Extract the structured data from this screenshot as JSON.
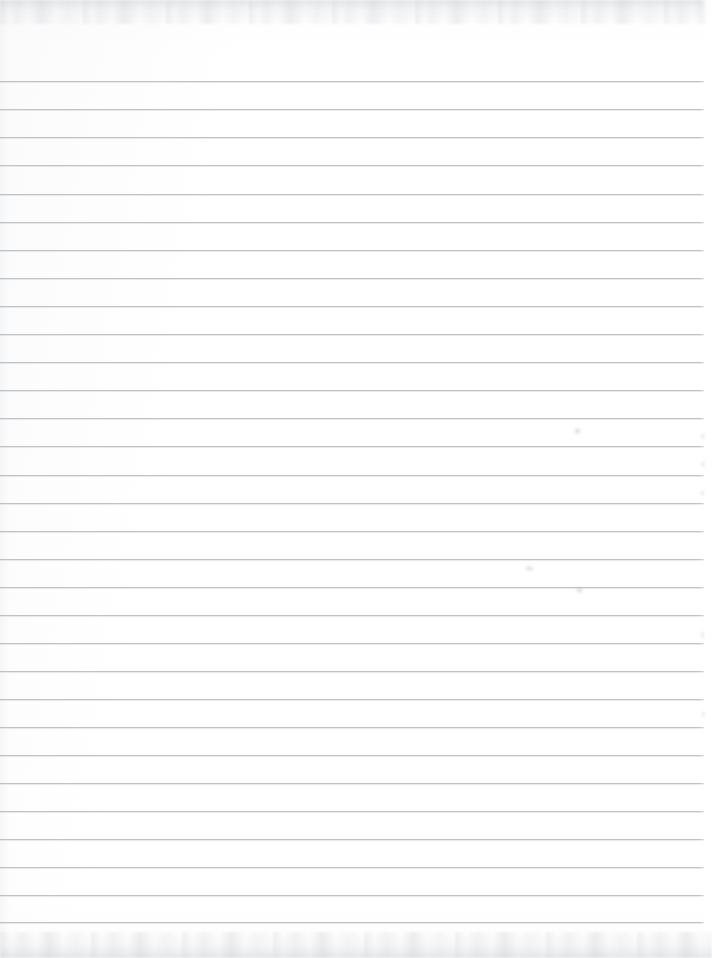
{
  "document": {
    "kind": "scanned-lined-paper",
    "title": "Blank ruled notebook paper scan",
    "page_width": 712,
    "page_height": 958,
    "text_content": "",
    "handwriting": "",
    "colors": {
      "paper": "#ffffff",
      "rule_line": "#bfc2c7",
      "rule_line_soft": "#cdd0d5",
      "scan_edge": "#c4c7cc"
    }
  },
  "ruling": {
    "line_count": 31,
    "first_line_y": 81,
    "spacing_px": 28.05,
    "line_left_x": 0,
    "line_right_x": 704,
    "line_thickness_px": 1,
    "lines_y": [
      81,
      109,
      137,
      165,
      194,
      222,
      250,
      278,
      306,
      334,
      362,
      390,
      418,
      446,
      475,
      503,
      531,
      559,
      587,
      615,
      643,
      671,
      699,
      727,
      755,
      783,
      811,
      839,
      867,
      895,
      922
    ]
  },
  "edges": {
    "top_band_label": "scan-edge-top",
    "top_band_height": 24,
    "bottom_band_label": "scan-edge-bottom",
    "bottom_band_height": 26,
    "right_margin_width": 12
  },
  "artifacts": [
    {
      "name": "smudge-right-upper",
      "x": 573,
      "y": 427,
      "w": 9,
      "h": 8
    },
    {
      "name": "smudge-right-edge-a",
      "x": 700,
      "y": 432,
      "w": 7,
      "h": 9
    },
    {
      "name": "smudge-right-edge-b",
      "x": 700,
      "y": 460,
      "w": 7,
      "h": 9
    },
    {
      "name": "smudge-right-edge-c",
      "x": 700,
      "y": 489,
      "w": 6,
      "h": 8
    },
    {
      "name": "smudge-mid-lower",
      "x": 524,
      "y": 565,
      "w": 11,
      "h": 7
    },
    {
      "name": "smudge-right-lower",
      "x": 575,
      "y": 586,
      "w": 9,
      "h": 8
    },
    {
      "name": "smudge-right-edge-d",
      "x": 700,
      "y": 630,
      "w": 6,
      "h": 10
    },
    {
      "name": "smudge-right-edge-e",
      "x": 701,
      "y": 710,
      "w": 6,
      "h": 9
    }
  ]
}
